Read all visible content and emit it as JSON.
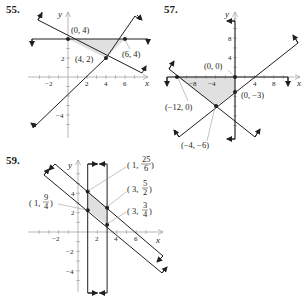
{
  "problems": [
    {
      "number": "55.",
      "axes": {
        "x_label": "x",
        "y_label": "y"
      },
      "x_ticks": [
        "−2",
        "2",
        "4",
        "6"
      ],
      "y_ticks": [
        "2",
        "−4"
      ],
      "vertices": [
        {
          "label": "(0, 4)",
          "x": 0,
          "y": 4
        },
        {
          "label": "(6, 4)",
          "x": 6,
          "y": 4
        },
        {
          "label": "(4, 2)",
          "x": 4,
          "y": 2
        }
      ],
      "shaded_region": "triangle (0,4)-(6,4)-(4,2)"
    },
    {
      "number": "57.",
      "axes": {
        "x_label": "x",
        "y_label": "y"
      },
      "x_ticks": [
        "−8",
        "−4",
        "4",
        "8"
      ],
      "y_ticks": [
        "8",
        "4"
      ],
      "vertices": [
        {
          "label": "(0, 0)",
          "x": 0,
          "y": 0
        },
        {
          "label": "(−12, 0)",
          "x": -12,
          "y": 0
        },
        {
          "label": "(0, −3)",
          "x": 0,
          "y": -3
        },
        {
          "label": "(−4, −6)",
          "x": -4,
          "y": -6
        }
      ],
      "shaded_region": "quadrilateral (-12,0)-(0,0)-(0,-3)-(-4,-6)"
    },
    {
      "number": "59.",
      "axes": {
        "x_label": "x",
        "y_label": "y"
      },
      "x_ticks": [
        "−2",
        "2",
        "4",
        "6"
      ],
      "y_ticks": [
        "4",
        "2",
        "−2",
        "−4"
      ],
      "vertices": [
        {
          "label_prefix": "1, ",
          "num": "25",
          "den": "6",
          "x": 1,
          "y": 4.1667
        },
        {
          "label_prefix": "1, ",
          "num": "9",
          "den": "4",
          "x": 1,
          "y": 2.25
        },
        {
          "label_prefix": "3, ",
          "num": "5",
          "den": "2",
          "x": 3,
          "y": 2.5
        },
        {
          "label_prefix": "3, ",
          "num": "3",
          "den": "4",
          "x": 3,
          "y": 0.75
        }
      ],
      "shaded_region": "parallelogram between x=1 and x=3 and two parallel lines"
    }
  ]
}
